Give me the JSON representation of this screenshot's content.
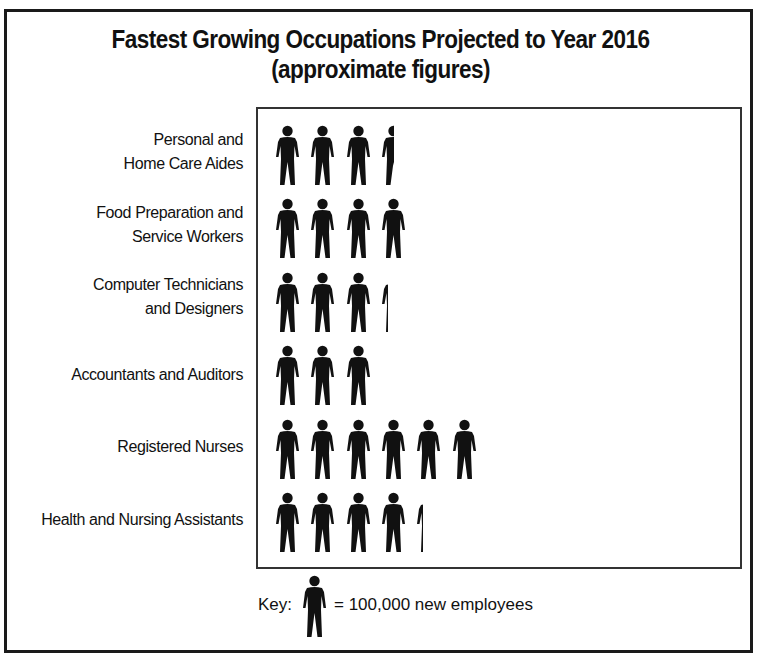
{
  "chart_data": {
    "type": "pictograph",
    "title": "Fastest Growing Occupations Projected to Year 2016",
    "subtitle": "(approximate figures)",
    "unit": "new employees",
    "icon_value": 100000,
    "categories": [
      "Personal and Home Care Aides",
      "Food Preparation and Service Workers",
      "Computer Technicians and Designers",
      "Accountants and Auditors",
      "Registered Nurses",
      "Health and Nursing Assistants"
    ],
    "icon_counts": [
      3.5,
      4,
      3.3,
      3,
      6,
      4.3
    ],
    "values": [
      350000,
      400000,
      330000,
      300000,
      600000,
      430000
    ],
    "legend": "Key: [person icon] = 100,000 new employees"
  },
  "title": {
    "line1": "Fastest Growing Occupations Projected to Year 2016",
    "line2": "(approximate figures)"
  },
  "rows": [
    {
      "line1": "Personal and",
      "line2": "Home Care Aides",
      "count": 3.5
    },
    {
      "line1": "Food Preparation and",
      "line2": "Service Workers",
      "count": 4
    },
    {
      "line1": "Computer Technicians",
      "line2": "and Designers",
      "count": 3.3
    },
    {
      "line1": "Accountants and Auditors",
      "line2": "",
      "count": 3
    },
    {
      "line1": "Registered Nurses",
      "line2": "",
      "count": 6
    },
    {
      "line1": "Health and Nursing Assistants",
      "line2": "",
      "count": 4.3
    }
  ],
  "key": {
    "label": "Key:",
    "text": "= 100,000 new employees",
    "icon": "person-icon"
  }
}
